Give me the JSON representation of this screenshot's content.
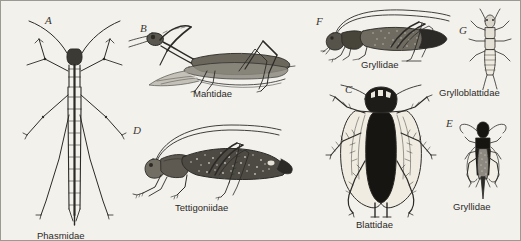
{
  "plate": {
    "width": 521,
    "height": 241,
    "background_color": "#f3f1ec",
    "border_color": "#9a9a93",
    "ink_color": "#2b2a27",
    "description": "Comparative plate of orthopteroid insect families, seven labelled line-drawing figures A through G"
  },
  "figures": [
    {
      "letter": "A",
      "caption": "Phasmidae",
      "common_name": "stick insect",
      "view": "dorsal",
      "letter_pos": {
        "x": 44,
        "y": 14
      },
      "caption_pos": {
        "x": 36,
        "y": 230
      },
      "art_pos": {
        "x": 18,
        "y": 10
      }
    },
    {
      "letter": "B",
      "caption": "Mantidae",
      "common_name": "praying mantis",
      "view": "lateral",
      "letter_pos": {
        "x": 139,
        "y": 22
      },
      "caption_pos": {
        "x": 192,
        "y": 88
      },
      "art_pos": {
        "x": 128,
        "y": 10
      }
    },
    {
      "letter": "D",
      "caption": "Tettigoniidae",
      "common_name": "katydid",
      "view": "lateral",
      "letter_pos": {
        "x": 132,
        "y": 124
      },
      "caption_pos": {
        "x": 174,
        "y": 202
      },
      "art_pos": {
        "x": 130,
        "y": 118
      }
    },
    {
      "letter": "F",
      "caption": "Gryllidae",
      "common_name": "cricket",
      "view": "lateral",
      "letter_pos": {
        "x": 315,
        "y": 15
      },
      "caption_pos": {
        "x": 360,
        "y": 59
      },
      "art_pos": {
        "x": 322,
        "y": 8
      }
    },
    {
      "letter": "C",
      "caption": "Blattidae",
      "common_name": "cockroach",
      "view": "dorsal",
      "letter_pos": {
        "x": 344,
        "y": 83
      },
      "caption_pos": {
        "x": 355,
        "y": 219
      },
      "art_pos": {
        "x": 326,
        "y": 84
      }
    },
    {
      "letter": "G",
      "caption": "Grylloblattidae",
      "common_name": "rock crawler",
      "view": "dorsal",
      "letter_pos": {
        "x": 466,
        "y": 25
      },
      "caption_pos": {
        "x": 438,
        "y": 87
      },
      "art_pos": {
        "x": 470,
        "y": 10
      }
    },
    {
      "letter": "E",
      "caption": "Gryllidae",
      "common_name": "cricket",
      "view": "dorsal",
      "letter_pos": {
        "x": 445,
        "y": 117
      },
      "caption_pos": {
        "x": 452,
        "y": 201
      },
      "art_pos": {
        "x": 458,
        "y": 122
      }
    }
  ]
}
